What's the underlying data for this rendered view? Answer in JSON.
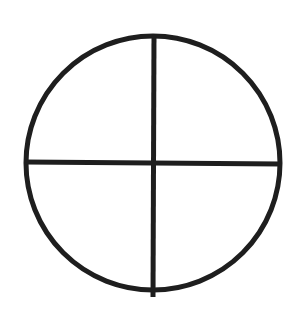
{
  "diagram": {
    "shape": "circle-divided-into-quadrants",
    "circle": {
      "cx": 153,
      "cy": 163,
      "r": 127
    },
    "stroke_color": "#1e1e1e",
    "stroke_width": 5,
    "background": "#ffffff",
    "vertical_divider": {
      "x1": 154,
      "y1": 35,
      "x2": 153,
      "y2": 297
    },
    "horizontal_divider": {
      "x1": 25,
      "y1": 162,
      "x2": 281,
      "y2": 164
    }
  }
}
